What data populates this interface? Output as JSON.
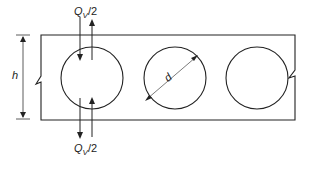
{
  "diagram": {
    "labels": {
      "shear_top": "Q",
      "shear_top_sub": "V",
      "shear_top_tail": "/2",
      "shear_bottom": "Q",
      "shear_bottom_sub": "V",
      "shear_bottom_tail": "/2",
      "height": "h",
      "diameter": "d"
    },
    "openings": [
      {
        "cx": 92,
        "cy": 78,
        "r": 31
      },
      {
        "cx": 175,
        "cy": 78,
        "r": 31
      },
      {
        "cx": 257,
        "cy": 78,
        "r": 31
      }
    ],
    "colors": {
      "stroke": "#222222",
      "background": "#ffffff"
    }
  }
}
